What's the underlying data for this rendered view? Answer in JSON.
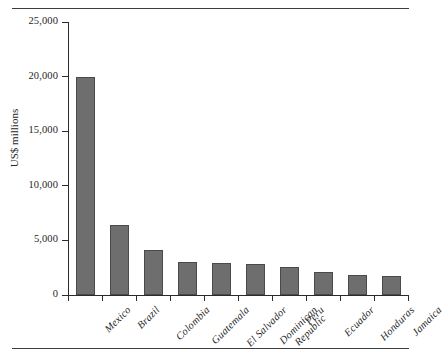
{
  "figure": {
    "has_top_rule": true,
    "has_bottom_rule": true
  },
  "chart_data": {
    "type": "bar",
    "title": "",
    "xlabel": "",
    "ylabel": "US$ millions",
    "ylim": [
      0,
      25000
    ],
    "yticks": [
      0,
      5000,
      10000,
      15000,
      20000,
      25000
    ],
    "ytick_labels": [
      "0",
      "5,000",
      "10,000",
      "15,000",
      "20,000",
      "25,000"
    ],
    "grid": false,
    "legend": null,
    "bar_color": "#6e6e6e",
    "bar_edge_color": "#4a4a4a",
    "categories": [
      "Mexico",
      "Brazil",
      "Colombia",
      "Guatemala",
      "El Salvador",
      "Dominican\nRepublic",
      "Peru",
      "Ecuador",
      "Honduras",
      "Jamaica"
    ],
    "values": [
      20000,
      6400,
      4150,
      3000,
      2950,
      2800,
      2550,
      2100,
      1800,
      1750
    ]
  }
}
